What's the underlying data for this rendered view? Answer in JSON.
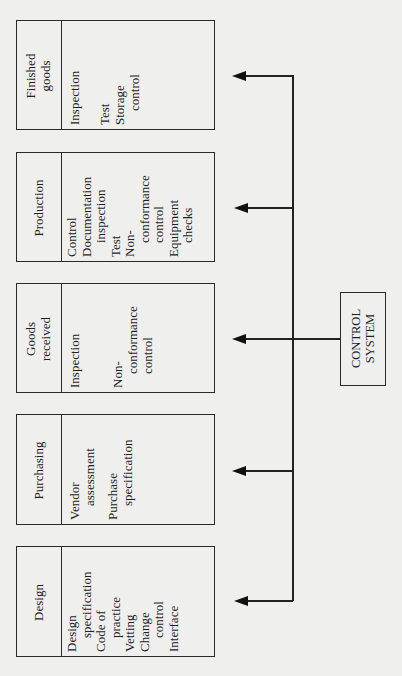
{
  "boxes": [
    {
      "title": [
        "Finished",
        "goods"
      ],
      "items": [
        {
          "text": "Inspection",
          "indent": false,
          "gap_after": true
        },
        {
          "text": "Test",
          "indent": false
        },
        {
          "text": "Storage",
          "indent": false
        },
        {
          "text": "control",
          "indent": true
        }
      ]
    },
    {
      "title": [
        "Production"
      ],
      "items": [
        {
          "text": "Control",
          "indent": false
        },
        {
          "text": "Documentation",
          "indent": false
        },
        {
          "text": "inspection",
          "indent": true
        },
        {
          "text": "Test",
          "indent": false
        },
        {
          "text": "Non-",
          "indent": false
        },
        {
          "text": "conformance",
          "indent": true
        },
        {
          "text": "control",
          "indent": true
        },
        {
          "text": "Equipment",
          "indent": false
        },
        {
          "text": "checks",
          "indent": true
        }
      ]
    },
    {
      "title": [
        "Goods",
        "received"
      ],
      "items": [
        {
          "text": "Inspection",
          "indent": false,
          "gap_after": true
        },
        {
          "text": "Non-",
          "indent": false
        },
        {
          "text": "conformance",
          "indent": true
        },
        {
          "text": "control",
          "indent": true
        }
      ]
    },
    {
      "title": [
        "Purchasing"
      ],
      "items": [
        {
          "text": "Vendor",
          "indent": false
        },
        {
          "text": "assessment",
          "indent": true,
          "gap_after": true
        },
        {
          "text": "Purchase",
          "indent": false
        },
        {
          "text": "specification",
          "indent": true
        }
      ]
    },
    {
      "title": [
        "Design"
      ],
      "items": [
        {
          "text": "Design",
          "indent": false
        },
        {
          "text": "specification",
          "indent": true
        },
        {
          "text": "Code of",
          "indent": false
        },
        {
          "text": "practice",
          "indent": true
        },
        {
          "text": "Vetting",
          "indent": false
        },
        {
          "text": "Change",
          "indent": false
        },
        {
          "text": "control",
          "indent": true
        },
        {
          "text": "Interface",
          "indent": false
        }
      ]
    }
  ],
  "control": {
    "line1": "CONTROL",
    "line2": "SYSTEM"
  }
}
